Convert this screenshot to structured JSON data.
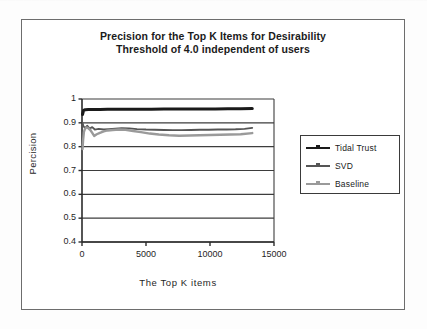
{
  "chart_data": {
    "type": "line",
    "title": "Precision for the Top K Items for Desirability Threshold of 4.0 independent of users",
    "title_line1": "Precision for the Top K Items for Desirability",
    "title_line2": "Threshold of 4.0 independent of users",
    "xlabel": "The Top K items",
    "ylabel": "Percision",
    "xlim": [
      0,
      15000
    ],
    "ylim": [
      0.4,
      1
    ],
    "xticks": [
      0,
      5000,
      10000,
      15000
    ],
    "xtick_labels": [
      "0",
      "5000",
      "10000",
      "15000"
    ],
    "yticks": [
      0.4,
      0.5,
      0.6,
      0.7,
      0.8,
      0.9,
      1
    ],
    "ytick_labels": [
      "0.4",
      "0.5",
      "0.6",
      "0.7",
      "0.8",
      "0.9",
      "1"
    ],
    "grid": "horizontal",
    "legend_position": "right",
    "colors": {
      "tidal_trust": "#1a1a1a",
      "svd": "#555555",
      "baseline": "#9a9a9a",
      "axis": "#2b2b2b",
      "gridline": "#3d3d3d",
      "frame": "#6d6d6d"
    },
    "series": [
      {
        "name": "Tidal Trust",
        "color": "#1a1a1a",
        "x": [
          40,
          120,
          250,
          500,
          900,
          1400,
          2000,
          2700,
          3500,
          4400,
          5400,
          6400,
          7400,
          8400,
          9400,
          10400,
          11400,
          12400,
          13300
        ],
        "values": [
          0.935,
          0.952,
          0.955,
          0.956,
          0.956,
          0.956,
          0.957,
          0.957,
          0.957,
          0.957,
          0.957,
          0.958,
          0.958,
          0.958,
          0.958,
          0.958,
          0.959,
          0.959,
          0.96
        ]
      },
      {
        "name": "SVD",
        "color": "#555555",
        "x": [
          40,
          120,
          250,
          400,
          600,
          800,
          1000,
          1300,
          1700,
          2100,
          2600,
          3100,
          3700,
          4300,
          5000,
          5700,
          6400,
          7100,
          7800,
          8500,
          9200,
          9900,
          10600,
          11300,
          12000,
          12700,
          13300
        ],
        "values": [
          0.9,
          0.885,
          0.878,
          0.888,
          0.876,
          0.882,
          0.872,
          0.875,
          0.872,
          0.874,
          0.876,
          0.878,
          0.877,
          0.874,
          0.872,
          0.871,
          0.87,
          0.869,
          0.869,
          0.87,
          0.871,
          0.871,
          0.872,
          0.872,
          0.873,
          0.875,
          0.879
        ]
      },
      {
        "name": "Baseline",
        "color": "#9a9a9a",
        "x": [
          40,
          90,
          150,
          220,
          300,
          400,
          520,
          650,
          800,
          950,
          1150,
          1400,
          1700,
          2000,
          2400,
          2900,
          3400,
          4000,
          4600,
          5300,
          6000,
          6800,
          7600,
          8400,
          9200,
          10000,
          10800,
          11600,
          12400,
          13300
        ],
        "values": [
          0.79,
          0.83,
          0.862,
          0.873,
          0.879,
          0.881,
          0.876,
          0.87,
          0.858,
          0.845,
          0.852,
          0.858,
          0.864,
          0.868,
          0.87,
          0.872,
          0.871,
          0.866,
          0.861,
          0.855,
          0.851,
          0.848,
          0.846,
          0.847,
          0.848,
          0.849,
          0.85,
          0.851,
          0.852,
          0.857
        ]
      }
    ]
  },
  "legend": {
    "items": [
      {
        "label": "Tidal Trust"
      },
      {
        "label": "SVD"
      },
      {
        "label": "Baseline"
      }
    ]
  }
}
